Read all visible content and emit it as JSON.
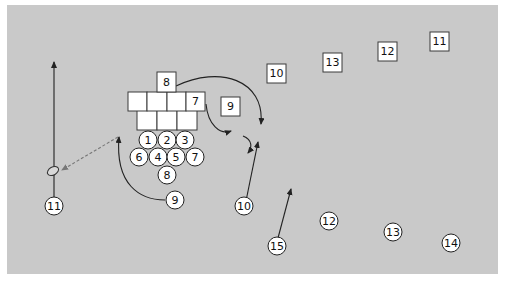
{
  "diagram": {
    "type": "rugby-scrum-play",
    "colors": {
      "field": "#c9c9c9",
      "player_fill": "#ffffff",
      "stroke": "#222222",
      "pass_line": "#777777"
    },
    "scrum_squares": {
      "front_row": [
        {
          "label": ""
        },
        {
          "label": ""
        },
        {
          "label": ""
        }
      ],
      "second_row": [
        {
          "label": ""
        },
        {
          "label": ""
        },
        {
          "label": ""
        },
        {
          "label": "7"
        }
      ],
      "number_8": {
        "label": "8"
      }
    },
    "defenders_squares": [
      {
        "label": "9"
      },
      {
        "label": "10"
      },
      {
        "label": "13"
      },
      {
        "label": "12"
      },
      {
        "label": "11"
      }
    ],
    "scrum_circles": {
      "front_row": [
        {
          "label": "1"
        },
        {
          "label": "2"
        },
        {
          "label": "3"
        }
      ],
      "second_row": [
        {
          "label": "6"
        },
        {
          "label": "4"
        },
        {
          "label": "5"
        },
        {
          "label": "7"
        }
      ],
      "number_8": {
        "label": "8"
      }
    },
    "attackers_circles": [
      {
        "label": "9"
      },
      {
        "label": "10"
      },
      {
        "label": "11"
      },
      {
        "label": "15"
      },
      {
        "label": "12"
      },
      {
        "label": "13"
      },
      {
        "label": "14"
      }
    ]
  }
}
